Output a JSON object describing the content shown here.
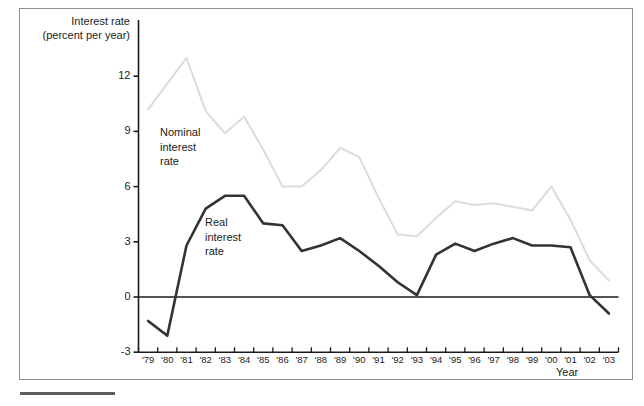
{
  "figure": {
    "y_axis_title_line1": "Interest rate",
    "y_axis_title_line2": "(percent per year)",
    "x_axis_title": "Year",
    "nominal_label_line1": "Nominal",
    "nominal_label_line2": "interest",
    "nominal_label_line3": "rate",
    "real_label_line1": "Real",
    "real_label_line2": "interest",
    "real_label_line3": "rate",
    "nominal_color": "#dcdcdc",
    "real_color": "#333333",
    "frame_color": "#8d8d8d",
    "axis_color": "#1b1b1b"
  },
  "chart_data": {
    "type": "line",
    "title": "Interest rate (percent per year)",
    "xlabel": "Year",
    "ylabel": "Interest rate (percent per year)",
    "ylim": [
      -3,
      14
    ],
    "xlim": [
      "'79",
      "'03"
    ],
    "yticks": [
      -3,
      0,
      3,
      6,
      9,
      12
    ],
    "ytick_labels": [
      "-3",
      "0",
      "3",
      "6",
      "9",
      "12"
    ],
    "grid": false,
    "legend": "inline annotations",
    "zero_line": 0,
    "categories": [
      "'79",
      "'80",
      "'81",
      "'82",
      "'83",
      "'84",
      "'85",
      "'86",
      "'87",
      "'88",
      "'89",
      "'90",
      "'91",
      "'92",
      "'93",
      "'94",
      "'95",
      "'96",
      "'97",
      "'98",
      "'99",
      "'00",
      "'01",
      "'02",
      "'03"
    ],
    "series": [
      {
        "name": "Nominal interest rate",
        "color": "#dcdcdc",
        "values": [
          10.2,
          11.6,
          13.0,
          10.1,
          8.9,
          9.8,
          8.0,
          6.0,
          6.0,
          6.9,
          8.1,
          7.6,
          5.4,
          3.4,
          3.3,
          4.3,
          5.2,
          5.0,
          5.1,
          4.9,
          4.7,
          6.0,
          4.2,
          2.0,
          0.9
        ]
      },
      {
        "name": "Real interest rate",
        "color": "#333333",
        "values": [
          -1.3,
          -2.1,
          2.8,
          4.8,
          5.5,
          5.5,
          4.0,
          3.9,
          2.5,
          2.8,
          3.2,
          2.5,
          1.7,
          0.8,
          0.1,
          2.3,
          2.9,
          2.5,
          2.9,
          3.2,
          2.8,
          2.8,
          2.7,
          0.1,
          -0.9
        ]
      }
    ]
  }
}
